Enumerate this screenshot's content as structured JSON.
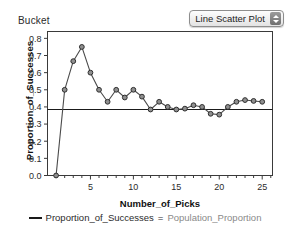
{
  "header": {
    "bucket_label": "Bucket",
    "plot_type_selector": {
      "value": "Line Scatter Plot",
      "stepper_up_icon": "triangle-up-icon",
      "stepper_down_icon": "triangle-down-icon"
    }
  },
  "legend": {
    "line_swatch_icon": "line-swatch-icon",
    "series_name": "Proportion_of_Successes",
    "equals": "=",
    "reference_name": "Population_Proportion"
  },
  "colors": {
    "frame": "#3a3a3a",
    "line": "#4a4a4a",
    "marker_fill": "#8f8f8f",
    "marker_stroke": "#2e2e2e",
    "reference_line": "#1a1a1a",
    "axis_text": "#2b2b2b",
    "grey_text": "#8a8a8a"
  },
  "chart_data": {
    "type": "line",
    "title": "",
    "xlabel": "Number_of_Picks",
    "ylabel": "Proportion_of_Successes",
    "xlim": [
      0,
      26.2
    ],
    "ylim": [
      0.0,
      0.84
    ],
    "xticks": [
      5,
      10,
      15,
      20,
      25
    ],
    "xtick_labels": [
      "5",
      "10",
      "15",
      "20",
      "25"
    ],
    "minor_xtick_step": 1,
    "yticks": [
      0.0,
      0.1,
      0.2,
      0.3,
      0.4,
      0.5,
      0.6,
      0.7,
      0.8
    ],
    "ytick_labels": [
      "0.0",
      "0.1",
      "0.2",
      "0.3",
      "0.4",
      "0.5",
      "0.6",
      "0.7",
      "0.8"
    ],
    "grid": false,
    "legend_position": "bottom",
    "reference_line": {
      "label": "Population_Proportion",
      "orientation": "horizontal",
      "y": 0.385
    },
    "series": [
      {
        "name": "Proportion_of_Successes",
        "marker": "circle",
        "x": [
          1,
          2,
          3,
          4,
          5,
          6,
          7,
          8,
          9,
          10,
          11,
          12,
          13,
          14,
          15,
          16,
          17,
          18,
          19,
          20,
          21,
          22,
          23,
          24,
          25
        ],
        "values": [
          0.0,
          0.5,
          0.667,
          0.75,
          0.6,
          0.5,
          0.43,
          0.5,
          0.455,
          0.5,
          0.46,
          0.385,
          0.43,
          0.4,
          0.385,
          0.39,
          0.41,
          0.4,
          0.36,
          0.355,
          0.4,
          0.43,
          0.44,
          0.435,
          0.43
        ]
      }
    ]
  }
}
